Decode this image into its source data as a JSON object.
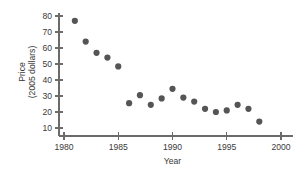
{
  "chart_data": {
    "type": "scatter",
    "title": "",
    "xlabel": "Year",
    "ylabel": "Price\n(2005 dollars)",
    "ylabel_line1": "Price",
    "ylabel_line2": "(2005 dollars)",
    "xlim": [
      1979,
      2001
    ],
    "ylim": [
      7,
      82
    ],
    "grid": false,
    "legend": false,
    "xticks": [
      1980,
      1985,
      1990,
      1995,
      2000
    ],
    "xticklabels": [
      "1980",
      "1985",
      "1990",
      "1995",
      "2000"
    ],
    "yticks": [
      10,
      20,
      30,
      40,
      50,
      60,
      70,
      80
    ],
    "yticklabels": [
      "10",
      "20",
      "30",
      "40",
      "50",
      "60",
      "70",
      "80"
    ],
    "marker": "circle",
    "marker_color": "#555555",
    "marker_size": 3.1,
    "x": [
      1981,
      1982,
      1983,
      1984,
      1985,
      1986,
      1987,
      1988,
      1989,
      1990,
      1991,
      1992,
      1993,
      1994,
      1995,
      1996,
      1997,
      1998
    ],
    "y": [
      77,
      64,
      57,
      54,
      48.5,
      25.5,
      30.5,
      24.5,
      28.5,
      34.5,
      29,
      26.5,
      22,
      20,
      21,
      24.5,
      22,
      14
    ],
    "points": [
      {
        "year": 1981,
        "price": 77
      },
      {
        "year": 1982,
        "price": 64
      },
      {
        "year": 1983,
        "price": 57
      },
      {
        "year": 1984,
        "price": 54
      },
      {
        "year": 1985,
        "price": 48.5
      },
      {
        "year": 1986,
        "price": 25.5
      },
      {
        "year": 1987,
        "price": 30.5
      },
      {
        "year": 1988,
        "price": 24.5
      },
      {
        "year": 1989,
        "price": 28.5
      },
      {
        "year": 1990,
        "price": 34.5
      },
      {
        "year": 1991,
        "price": 29
      },
      {
        "year": 1992,
        "price": 26.5
      },
      {
        "year": 1993,
        "price": 22
      },
      {
        "year": 1994,
        "price": 20
      },
      {
        "year": 1995,
        "price": 21
      },
      {
        "year": 1996,
        "price": 24.5
      },
      {
        "year": 1997,
        "price": 22
      },
      {
        "year": 1998,
        "price": 14
      }
    ]
  },
  "colors": {
    "marker": "#555555",
    "axis": "#6b6b6b",
    "text": "#3a3a3a",
    "background": "#ffffff"
  }
}
